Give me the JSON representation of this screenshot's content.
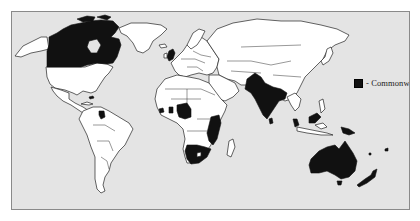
{
  "map": {
    "title": "",
    "colors": {
      "ocean": "#e4e4e4",
      "land": "#ffffff",
      "commonwealth": "#111111",
      "outline": "#222222"
    },
    "legend": {
      "swatch": "black-square",
      "label": "- Commonwealth"
    },
    "highlighted_regions": [
      "Canada",
      "United Kingdom",
      "Belize",
      "Guyana",
      "Jamaica",
      "Bahamas",
      "Sierra Leone",
      "Ghana",
      "Nigeria",
      "Cameroon",
      "Kenya",
      "Uganda",
      "Tanzania",
      "Zambia",
      "Malawi",
      "Mozambique",
      "Namibia",
      "Botswana",
      "South Africa",
      "Pakistan",
      "India",
      "Bangladesh",
      "Sri Lanka",
      "Malaysia",
      "Papua New Guinea",
      "Australia",
      "New Zealand"
    ]
  }
}
